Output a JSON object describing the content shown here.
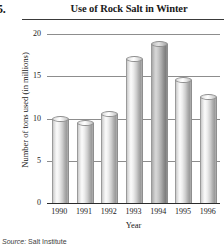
{
  "item_number": "5.",
  "source_label": "Source:",
  "source_value": "Salt Institute",
  "colors": {
    "bar_light": "#cfcfcf",
    "bar_dark": "#a0a0a0",
    "gridline": "#8d8d8d",
    "axis": "#2b2b2b",
    "text": "#1a1a1a"
  },
  "chart_data": {
    "type": "bar",
    "title": "Use of Rock Salt in Winter",
    "xlabel": "Year",
    "ylabel": "Number of tons used (in millions)",
    "categories": [
      "1990",
      "1991",
      "1992",
      "1993",
      "1994",
      "1995",
      "1996"
    ],
    "values": [
      10,
      9.5,
      10.5,
      17,
      18.8,
      14.5,
      12.5
    ],
    "ylim": [
      0,
      20
    ],
    "yticks": [
      0,
      5,
      10,
      15,
      20
    ],
    "ytick_labels": [
      "0",
      "5",
      "10",
      "15",
      "20"
    ],
    "grid": true,
    "legend": "none",
    "highlight_index": 4
  }
}
